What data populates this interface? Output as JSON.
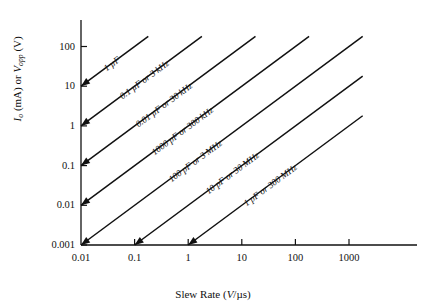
{
  "chart_data": {
    "type": "line",
    "title": "",
    "xlabel": "Slew Rate (V/µs)",
    "xlabel_text": "Slew Rate (",
    "xlabel_unit": "V",
    "xlabel_tail": "/µs)",
    "ylabel": "Iₒ (mA) or Vₒₚₚ (V)",
    "ylabel_parts": {
      "sym1": "I",
      "sub1": "o",
      "mid": " (mA) or ",
      "sym2": "V",
      "sub2": "opp",
      "tail": " (V)"
    },
    "xscale": "log",
    "yscale": "log",
    "xlim": [
      0.01,
      10000
    ],
    "ylim": [
      0.001,
      300
    ],
    "xticks": [
      "0.01",
      "0.1",
      "1",
      "10",
      "100",
      "1000"
    ],
    "xtick_values": [
      0.01,
      0.1,
      1,
      10,
      100,
      1000
    ],
    "yticks": [
      "100",
      "10",
      "1",
      "0.1",
      "0.01",
      "0.001"
    ],
    "ytick_values": [
      100,
      10,
      1,
      0.1,
      0.01,
      0.001
    ],
    "grid": false,
    "legend": "inline-labels",
    "slope_note": "All lines slope +1 decade per decade (log-log)",
    "series": [
      {
        "name": "1 µF",
        "label": "1 µF",
        "start": {
          "x": 0.01,
          "y": 10
        },
        "end": {
          "x": 0.18,
          "y": 180
        },
        "terminates_at": "y-axis"
      },
      {
        "name": "0.1 µF or 3 kHz",
        "label": "0.1 µF or 3 kHz",
        "start": {
          "x": 0.01,
          "y": 1
        },
        "end": {
          "x": 1.8,
          "y": 180
        },
        "terminates_at": "y-axis"
      },
      {
        "name": "0.01 µF or 30 kHz",
        "label": "0.01 µF or 30 kHz",
        "start": {
          "x": 0.01,
          "y": 0.1
        },
        "end": {
          "x": 18,
          "y": 180
        },
        "terminates_at": "y-axis"
      },
      {
        "name": "1000 pF or 300 kHz",
        "label": "1000 pF or 300 kHz",
        "start": {
          "x": 0.01,
          "y": 0.01
        },
        "end": {
          "x": 180,
          "y": 180
        },
        "terminates_at": "y-axis"
      },
      {
        "name": "100 pF or 3 MHz",
        "label": "100 pF or 3 MHz",
        "start": {
          "x": 0.01,
          "y": 0.001
        },
        "end": {
          "x": 1800,
          "y": 180
        },
        "terminates_at": "origin"
      },
      {
        "name": "10 pF or 30 MHz",
        "label": "10 pF or 30 MHz",
        "start": {
          "x": 0.1,
          "y": 0.001
        },
        "end": {
          "x": 1800,
          "y": 18
        },
        "terminates_at": "x-axis"
      },
      {
        "name": "1 pF or 300 MHz",
        "label": "1 pF or 300 MHz",
        "start": {
          "x": 1,
          "y": 0.001
        },
        "end": {
          "x": 1800,
          "y": 1.8
        },
        "terminates_at": "x-axis"
      }
    ]
  }
}
